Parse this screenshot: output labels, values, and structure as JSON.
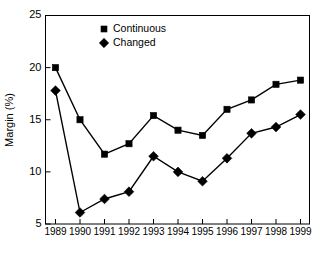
{
  "chart_data": {
    "type": "line",
    "title": "",
    "subtitle": "",
    "xlabel": "",
    "ylabel": "Margin (%)",
    "categories": [
      "1989",
      "1990",
      "1991",
      "1992",
      "1993",
      "1994",
      "1995",
      "1996",
      "1997",
      "1998",
      "1999"
    ],
    "x": [
      1989,
      1990,
      1991,
      1992,
      1993,
      1994,
      1995,
      1996,
      1997,
      1998,
      1999
    ],
    "series": [
      {
        "name": "Continuous",
        "marker": "square",
        "color": "#000000",
        "values": [
          20.0,
          15.0,
          11.7,
          12.7,
          15.4,
          14.0,
          13.5,
          16.0,
          16.9,
          18.4,
          18.8
        ]
      },
      {
        "name": "Changed",
        "marker": "diamond",
        "color": "#000000",
        "values": [
          17.8,
          6.1,
          7.4,
          8.1,
          11.5,
          10.0,
          9.1,
          11.3,
          13.7,
          14.3,
          15.5
        ]
      }
    ],
    "ylim": [
      5,
      25
    ],
    "yticks": [
      5,
      10,
      15,
      20,
      25
    ],
    "ytick_labels": [
      "5",
      "10",
      "15",
      "20",
      "25"
    ],
    "xtick_labels": [
      "1989",
      "1990",
      "1991",
      "1992",
      "1993",
      "1994",
      "1995",
      "1996",
      "1997",
      "1998",
      "1999"
    ],
    "grid": false,
    "legend_position": "top-center",
    "legend_entries": [
      {
        "label": "Continuous",
        "marker": "square"
      },
      {
        "label": "Changed",
        "marker": "diamond"
      }
    ],
    "axis_color": "#000000",
    "background_color": "#ffffff"
  }
}
